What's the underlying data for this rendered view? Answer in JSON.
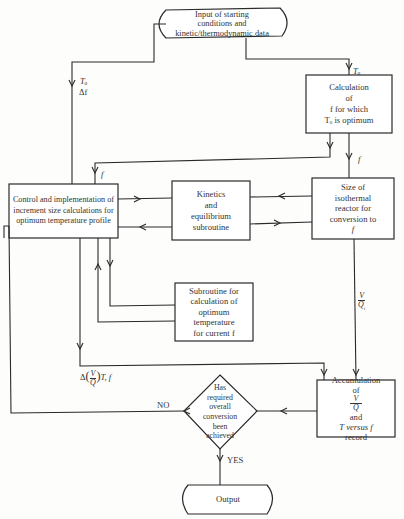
{
  "diagram": {
    "type": "flowchart",
    "nodes": {
      "input": {
        "lines": [
          "Input of starting",
          "conditions and",
          "kinetic/thermodynamic data"
        ],
        "shape": "terminal"
      },
      "calc_f": {
        "lines": [
          "Calculation",
          "of",
          "f for which",
          "Tₒ is optimum"
        ],
        "shape": "process"
      },
      "control": {
        "lines": [
          "Control and implementation of",
          "increment size calculations for",
          "optimum temperature profile"
        ],
        "shape": "process"
      },
      "kinetics": {
        "lines": [
          "Kinetics",
          "and",
          "equilibrium",
          "subroutine"
        ],
        "shape": "process"
      },
      "size": {
        "lines": [
          "Size of",
          "isothermal",
          "reactor for",
          "conversion to",
          "f"
        ],
        "shape": "process"
      },
      "subroutine": {
        "lines": [
          "Subroutine for",
          "calculation of",
          "optimum",
          "temperature",
          "for current f"
        ],
        "shape": "process"
      },
      "accum": {
        "line1": "Accumulation",
        "line2_pre": "of",
        "frac_num": "V",
        "frac_den": "Q",
        "line2_post": "and",
        "line3": "T versus f",
        "line4": "record",
        "shape": "process"
      },
      "decision": {
        "lines": [
          "Has",
          "required",
          "overall",
          "conversion",
          "been",
          "achieved"
        ],
        "shape": "decision"
      },
      "output": {
        "lines": [
          "Output"
        ],
        "shape": "terminal"
      }
    },
    "edge_labels": {
      "to_calc": "Tₒ",
      "to_control_a": "Tₒ",
      "to_control_b": "Δf",
      "f_left": "f",
      "f_right": "f",
      "vq_num": "V",
      "vq_den": "Q",
      "vq_sub": "i",
      "delta_pre": "Δ",
      "delta_num": "V",
      "delta_den": "Q",
      "delta_post": "T, f",
      "no": "NO",
      "yes": "YES"
    }
  }
}
